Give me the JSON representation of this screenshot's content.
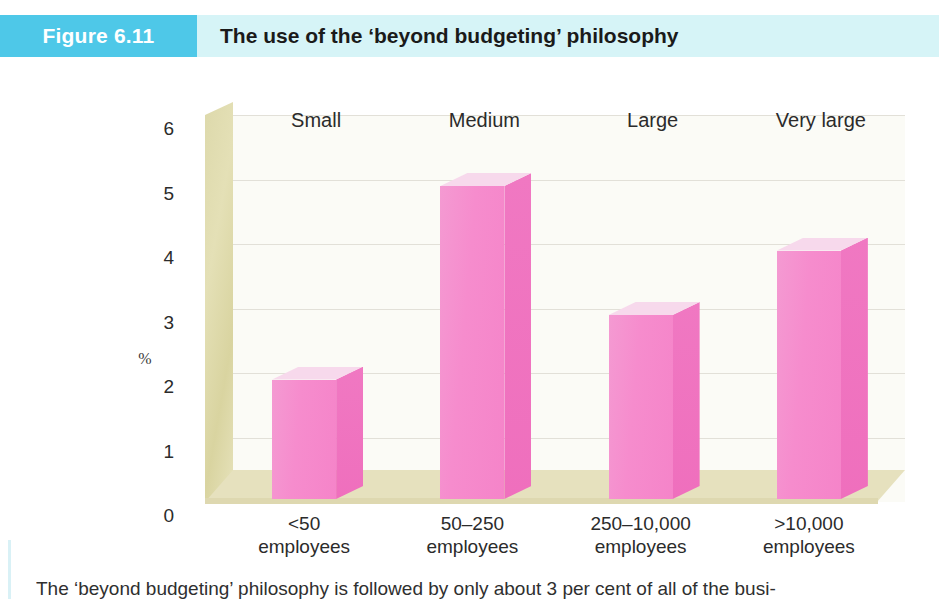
{
  "header": {
    "figure_number": "Figure 6.11",
    "title": "The use of the ‘beyond budgeting’ philosophy",
    "box_color": "#4ec8e8",
    "band_color": "#d6f4f7"
  },
  "caption": {
    "text": "The ‘beyond budgeting’ philosophy is followed by only about 3 per cent of all of the busi-"
  },
  "chart_data": {
    "type": "bar",
    "title": "The use of the ‘beyond budgeting’ philosophy",
    "xlabel": "",
    "ylabel": "%",
    "ylim": [
      0,
      6
    ],
    "yticks": [
      "0",
      "1",
      "2",
      "3",
      "4",
      "5",
      "6"
    ],
    "grid": true,
    "legend": "none",
    "bar_color": "#f584c9",
    "bar_top_color": "#f7d9ec",
    "bar_side_color": "#ef6fbd",
    "floor_color": "#e6e1be",
    "wall_color": "#ddd9ab",
    "plot_background": "#fbfbf6",
    "categories": [
      "<50\nemployees",
      "50–250\nemployees",
      "250–10,000\nemployees",
      ">10,000\nemployees"
    ],
    "category_sizes": [
      "Small",
      "Medium",
      "Large",
      "Very large"
    ],
    "values": [
      2.1,
      5.1,
      3.1,
      4.1
    ],
    "series": [
      {
        "name": "% of businesses using beyond budgeting",
        "values": [
          2.1,
          5.1,
          3.1,
          4.1
        ]
      }
    ],
    "bars": [
      {
        "size_label": "Small",
        "employees_line1": "<50",
        "employees_line2": "employees",
        "value": 2.1
      },
      {
        "size_label": "Medium",
        "employees_line1": "50–250",
        "employees_line2": "employees",
        "value": 5.1
      },
      {
        "size_label": "Large",
        "employees_line1": "250–10,000",
        "employees_line2": "employees",
        "value": 3.1
      },
      {
        "size_label": "Very large",
        "employees_line1": ">10,000",
        "employees_line2": "employees",
        "value": 4.1
      }
    ]
  }
}
